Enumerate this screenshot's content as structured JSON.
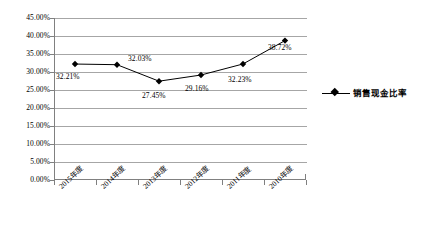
{
  "chart_data": {
    "type": "line",
    "title": "",
    "subtitle": "",
    "xlabel": "",
    "ylabel": "",
    "categories": [
      "2015年度",
      "2014年度",
      "2013年度",
      "2012年度",
      "2011年度",
      "2010年度"
    ],
    "values": [
      32.21,
      32.03,
      27.45,
      29.16,
      32.23,
      38.72
    ],
    "point_labels": [
      "32.21%",
      "32.03%",
      "27.45%",
      "29.16%",
      "32.23%",
      "38.72%"
    ],
    "series": [
      {
        "name": "销售现金比率",
        "values": [
          32.21,
          32.03,
          27.45,
          29.16,
          32.23,
          38.72
        ],
        "marker": "diamond",
        "color": "#000000"
      }
    ],
    "ylim": [
      0,
      45
    ],
    "ytick_step": 5,
    "ytick_labels": [
      "45.00%",
      "40.00%",
      "35.00%",
      "30.00%",
      "25.00%",
      "20.00%",
      "15.00%",
      "10.00%",
      "5.00%",
      "0.00%"
    ],
    "ytick_values": [
      45,
      40,
      35,
      30,
      25,
      20,
      15,
      10,
      5,
      0
    ],
    "grid": true,
    "grid_color": "#a6a6a6",
    "axis_color": "#808080",
    "legend_position": "right",
    "legend_entries": [
      "销售现金比率"
    ],
    "background": "#ffffff"
  }
}
